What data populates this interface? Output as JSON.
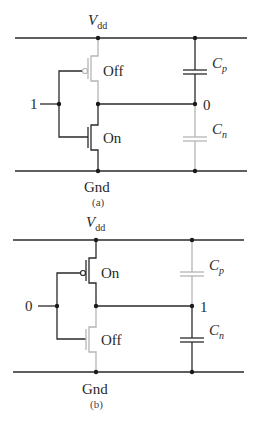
{
  "panels": [
    {
      "id": "a",
      "caption": "(a)",
      "supply_label": "V",
      "supply_sub": "dd",
      "ground_label": "Gnd",
      "input_value": "1",
      "output_value": "0",
      "pmos_state": "Off",
      "nmos_state": "On",
      "cp_label": "C",
      "cp_sub": "p",
      "cn_label": "C",
      "cn_sub": "n"
    },
    {
      "id": "b",
      "caption": "(b)",
      "supply_label": "V",
      "supply_sub": "dd",
      "ground_label": "Gnd",
      "input_value": "0",
      "output_value": "1",
      "pmos_state": "On",
      "nmos_state": "Off",
      "cp_label": "C",
      "cp_sub": "p",
      "cn_label": "C",
      "cn_sub": "n"
    }
  ],
  "colors": {
    "active_wire": "#2a2a2a",
    "inactive_wire": "#b5b5b5"
  }
}
